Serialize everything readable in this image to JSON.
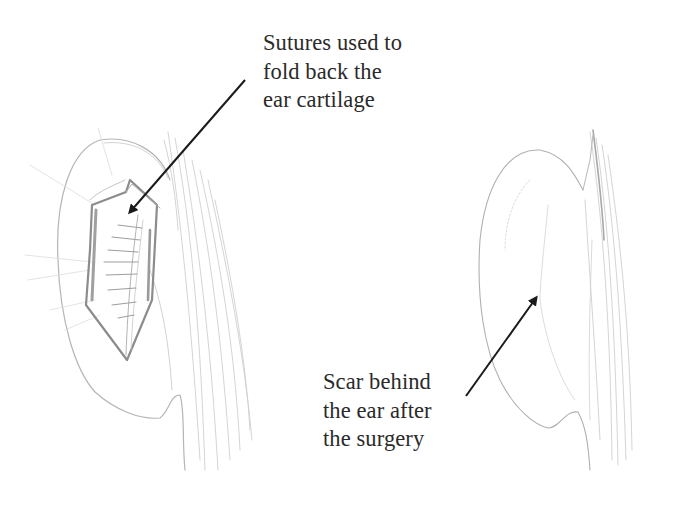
{
  "figure": {
    "colors": {
      "background": "#ffffff",
      "text": "#2a2a2a",
      "arrow": "#1a1a1a",
      "sketch_light": "#c8c8c8",
      "sketch_mid": "#a8a8a8",
      "sketch_dark": "#8a8a8a"
    }
  },
  "annotations": [
    {
      "id": "sutures",
      "lines": [
        "Sutures used to",
        "fold back the",
        "ear cartilage"
      ],
      "arrow": {
        "from": [
          245,
          80
        ],
        "to": [
          128,
          215
        ]
      }
    },
    {
      "id": "scar",
      "lines": [
        "Scar behind",
        "the ear after",
        "the surgery"
      ],
      "arrow": {
        "from": [
          466,
          396
        ],
        "to": [
          538,
          295
        ]
      }
    }
  ],
  "panels": [
    {
      "id": "left-ear",
      "caption": "Ear with exposed cartilage and sutures"
    },
    {
      "id": "right-ear",
      "caption": "Ear after surgery with scar behind"
    }
  ]
}
